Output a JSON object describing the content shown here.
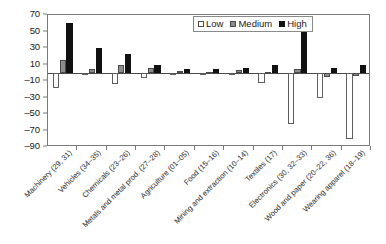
{
  "chart_data": {
    "type": "bar",
    "title": "",
    "xlabel": "",
    "ylabel": "",
    "ylim": [
      -90,
      70
    ],
    "ytick_step": 20,
    "yticks": [
      70,
      50,
      30,
      10,
      -10,
      -30,
      -50,
      -70,
      -90
    ],
    "ytick_labels": [
      "70",
      "50",
      "30",
      "10",
      "–10",
      "–30",
      "–50",
      "–70",
      "–90"
    ],
    "grid": false,
    "legend_position": "top-center",
    "legend": [
      "Low",
      "Medium",
      "High"
    ],
    "categories": [
      "Machinery (29, 31)",
      "Vehicles (34–35)",
      "Chemicals (23–26)",
      "Metals and metal prod. (27–28)",
      "Agriculture (01–05)",
      "Food (15–16)",
      "Mining and extraction (10–14)",
      "Textiles (17)",
      "Electronics (30, 32–33)",
      "Wood and paper (20–22, 36)",
      "Wearing apparel (18–19)"
    ],
    "series": [
      {
        "name": "Low",
        "color": "#ffffff",
        "values": [
          -18,
          -1,
          -14,
          -6,
          -1,
          -1,
          0,
          -12,
          -62,
          -30,
          -80
        ]
      },
      {
        "name": "Medium",
        "color": "#8d8d8d",
        "values": [
          15,
          4,
          9,
          6,
          2,
          1,
          3,
          1,
          5,
          -5,
          -4
        ]
      },
      {
        "name": "High",
        "color": "#111111",
        "values": [
          60,
          30,
          23,
          10,
          5,
          5,
          6,
          9,
          50,
          6,
          9
        ]
      }
    ]
  },
  "legend": {
    "low_label": "Low",
    "medium_label": "Medium",
    "high_label": "High"
  }
}
